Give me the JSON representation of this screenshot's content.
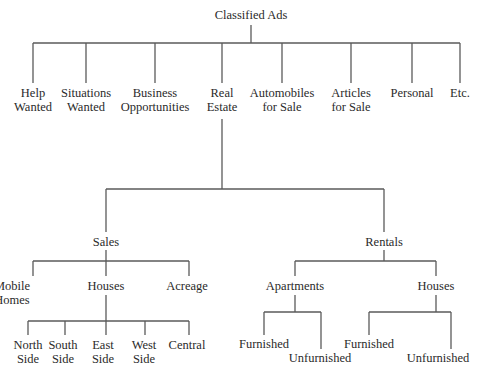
{
  "diagram": {
    "title": "Classified Ads",
    "line_color": "#5a5a5a",
    "text_color": "#2a2a2a",
    "nodes": [
      {
        "id": "root",
        "lines": [
          "Classified Ads"
        ],
        "x": 251,
        "y": 19
      },
      {
        "id": "help-wanted",
        "lines": [
          "Help",
          "Wanted"
        ],
        "x": 33,
        "y": 97
      },
      {
        "id": "situations-wanted",
        "lines": [
          "Situations",
          "Wanted"
        ],
        "x": 86,
        "y": 97
      },
      {
        "id": "business-opportunities",
        "lines": [
          "Business",
          "Opportunities"
        ],
        "x": 155,
        "y": 97
      },
      {
        "id": "real-estate",
        "lines": [
          "Real",
          "Estate"
        ],
        "x": 222,
        "y": 97
      },
      {
        "id": "automobiles-for-sale",
        "lines": [
          "Automobiles",
          "for Sale"
        ],
        "x": 282,
        "y": 97
      },
      {
        "id": "articles-for-sale",
        "lines": [
          "Articles",
          "for Sale"
        ],
        "x": 351,
        "y": 97
      },
      {
        "id": "personal",
        "lines": [
          "Personal"
        ],
        "x": 412,
        "y": 97
      },
      {
        "id": "etc",
        "lines": [
          "Etc."
        ],
        "x": 460,
        "y": 97
      },
      {
        "id": "sales",
        "lines": [
          "Sales"
        ],
        "x": 106,
        "y": 246
      },
      {
        "id": "rentals",
        "lines": [
          "Rentals"
        ],
        "x": 384,
        "y": 246
      },
      {
        "id": "mobile-homes",
        "lines": [
          "Mobile",
          "Homes"
        ],
        "x": 30,
        "y": 290,
        "anchor": "start-ish"
      },
      {
        "id": "sales-houses",
        "lines": [
          "Houses"
        ],
        "x": 106,
        "y": 290
      },
      {
        "id": "acreage",
        "lines": [
          "Acreage"
        ],
        "x": 187,
        "y": 290
      },
      {
        "id": "north-side",
        "lines": [
          "North",
          "Side"
        ],
        "x": 28,
        "y": 349
      },
      {
        "id": "south-side",
        "lines": [
          "South",
          "Side"
        ],
        "x": 63,
        "y": 349
      },
      {
        "id": "east-side",
        "lines": [
          "East",
          "Side"
        ],
        "x": 103,
        "y": 349
      },
      {
        "id": "west-side",
        "lines": [
          "West",
          "Side"
        ],
        "x": 144,
        "y": 349
      },
      {
        "id": "central",
        "lines": [
          "Central"
        ],
        "x": 187,
        "y": 349
      },
      {
        "id": "apartments",
        "lines": [
          "Apartments"
        ],
        "x": 295,
        "y": 290
      },
      {
        "id": "rental-houses",
        "lines": [
          "Houses"
        ],
        "x": 436,
        "y": 290
      },
      {
        "id": "apt-furnished",
        "lines": [
          "Furnished"
        ],
        "x": 264,
        "y": 348
      },
      {
        "id": "apt-unfurnished",
        "lines": [
          "Unfurnished"
        ],
        "x": 320,
        "y": 362
      },
      {
        "id": "house-furnished",
        "lines": [
          "Furnished"
        ],
        "x": 369,
        "y": 348
      },
      {
        "id": "house-unfurnished",
        "lines": [
          "Unfurnished"
        ],
        "x": 438,
        "y": 362
      }
    ],
    "edges": [
      {
        "d": "M251 25 V43"
      },
      {
        "d": "M33 43 H460"
      },
      {
        "d": "M33 43 V83"
      },
      {
        "d": "M86 43 V83"
      },
      {
        "d": "M155 43 V83"
      },
      {
        "d": "M222 43 V83"
      },
      {
        "d": "M282 43 V83"
      },
      {
        "d": "M351 43 V83"
      },
      {
        "d": "M412 43 V83"
      },
      {
        "d": "M460 43 V83"
      },
      {
        "d": "M222 119 V189"
      },
      {
        "d": "M106 189 H384"
      },
      {
        "d": "M106 189 V232"
      },
      {
        "d": "M384 189 V232"
      },
      {
        "d": "M106 250 V261"
      },
      {
        "d": "M33 261 H189"
      },
      {
        "d": "M33 261 V276"
      },
      {
        "d": "M106 261 V276"
      },
      {
        "d": "M189 261 V276"
      },
      {
        "d": "M106 295 V321"
      },
      {
        "d": "M28 321 H189"
      },
      {
        "d": "M28 321 V335"
      },
      {
        "d": "M65 321 V335"
      },
      {
        "d": "M106 321 V335"
      },
      {
        "d": "M145 321 V335"
      },
      {
        "d": "M189 321 V335"
      },
      {
        "d": "M384 250 V261"
      },
      {
        "d": "M295 261 H436"
      },
      {
        "d": "M295 261 V276"
      },
      {
        "d": "M436 261 V276"
      },
      {
        "d": "M295 295 V312"
      },
      {
        "d": "M264 312 H321"
      },
      {
        "d": "M264 312 V335"
      },
      {
        "d": "M321 312 V349"
      },
      {
        "d": "M436 295 V312"
      },
      {
        "d": "M369 312 H451"
      },
      {
        "d": "M369 312 V335"
      },
      {
        "d": "M451 312 V349"
      }
    ]
  }
}
